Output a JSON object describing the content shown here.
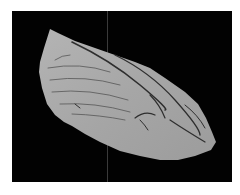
{
  "figure": {
    "background": "#020202",
    "surface_color": "#a9a9a9",
    "ridge_color": "#2a2a2a",
    "divider_color": "#3a3a3a"
  }
}
